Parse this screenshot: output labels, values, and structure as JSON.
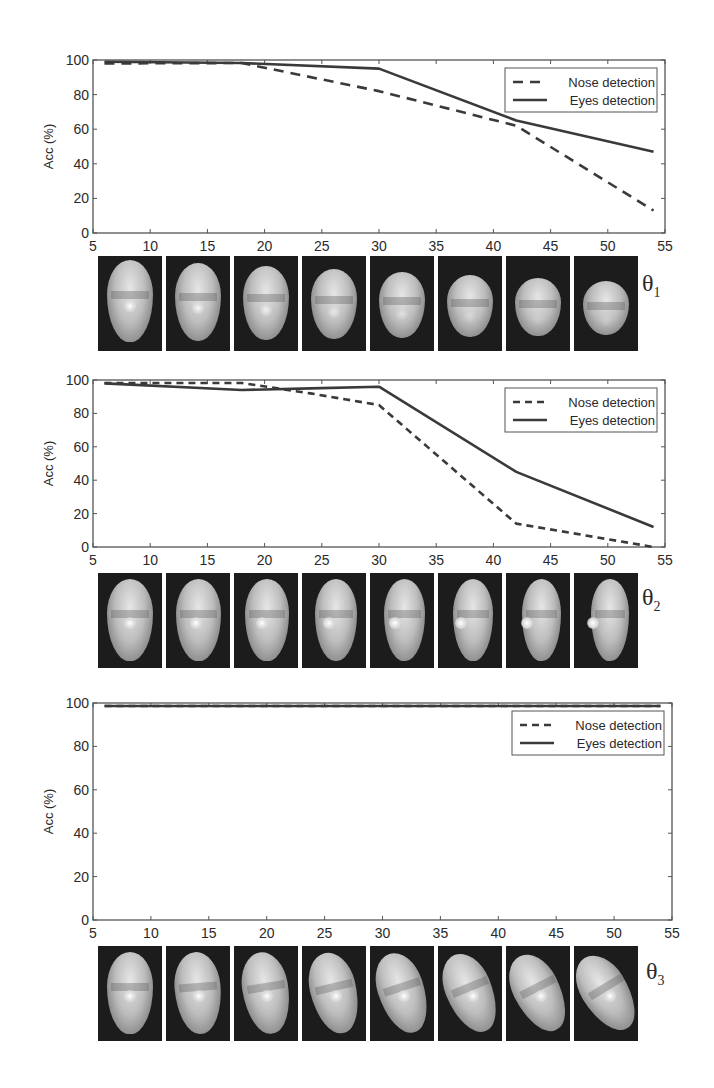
{
  "chart_data": [
    {
      "type": "line",
      "title": "",
      "xlabel": "",
      "ylabel": "Acc (%)",
      "xlim": [
        5,
        55
      ],
      "ylim": [
        0,
        100
      ],
      "xticks": [
        5,
        10,
        15,
        20,
        25,
        30,
        35,
        40,
        45,
        50,
        55
      ],
      "yticks": [
        0,
        20,
        40,
        60,
        80,
        100
      ],
      "grid": false,
      "legend_position": "upper right",
      "x": [
        6,
        18,
        30,
        42,
        54
      ],
      "series": [
        {
          "name": "Nose detection",
          "style": "dashed",
          "values": [
            98,
            100,
            82,
            62,
            13
          ]
        },
        {
          "name": "Eyes detection",
          "style": "solid",
          "values": [
            99,
            100,
            95,
            65,
            47
          ]
        }
      ],
      "image_strip_label": "θ1"
    },
    {
      "type": "line",
      "title": "",
      "xlabel": "",
      "ylabel": "Acc (%)",
      "xlim": [
        5,
        55
      ],
      "ylim": [
        0,
        100
      ],
      "xticks": [
        5,
        10,
        15,
        20,
        25,
        30,
        35,
        40,
        45,
        50,
        55
      ],
      "yticks": [
        0,
        20,
        40,
        60,
        80,
        100
      ],
      "grid": false,
      "legend_position": "upper right",
      "x": [
        6,
        18,
        24,
        30,
        42,
        54
      ],
      "series": [
        {
          "name": "Nose detection",
          "style": "dotted-dashed",
          "values": [
            100,
            100,
            92,
            85,
            14,
            0
          ]
        },
        {
          "name": "Eyes detection",
          "style": "solid",
          "values": [
            98,
            94,
            95,
            96,
            45,
            12
          ]
        }
      ],
      "image_strip_label": "θ2"
    },
    {
      "type": "line",
      "title": "",
      "xlabel": "",
      "ylabel": "Acc (%)",
      "xlim": [
        5,
        55
      ],
      "ylim": [
        0,
        100
      ],
      "xticks": [
        5,
        10,
        15,
        20,
        25,
        30,
        35,
        40,
        45,
        50,
        55
      ],
      "yticks": [
        0,
        20,
        40,
        60,
        80,
        100
      ],
      "grid": false,
      "legend_position": "upper right",
      "x": [
        6,
        18,
        30,
        42,
        54
      ],
      "series": [
        {
          "name": "Nose detection",
          "style": "dotted-dashed",
          "values": [
            100,
            100,
            100,
            100,
            100
          ]
        },
        {
          "name": "Eyes detection",
          "style": "solid",
          "values": [
            100,
            100,
            100,
            100,
            100
          ]
        }
      ],
      "image_strip_label": "θ3"
    }
  ],
  "panels": [
    {
      "ylabel": "Acc (%)",
      "legend": [
        "Nose detection",
        "Eyes detection"
      ],
      "theta_base": "θ",
      "theta_sub": "1"
    },
    {
      "ylabel": "Acc (%)",
      "legend": [
        "Nose detection",
        "Eyes detection"
      ],
      "theta_base": "θ",
      "theta_sub": "2"
    },
    {
      "ylabel": "Acc (%)",
      "legend": [
        "Nose detection",
        "Eyes detection"
      ],
      "theta_base": "θ",
      "theta_sub": "3"
    }
  ],
  "colors": {
    "line": "#3a3a3a",
    "axis": "#555555",
    "face_bg": "#1c1c1c"
  }
}
